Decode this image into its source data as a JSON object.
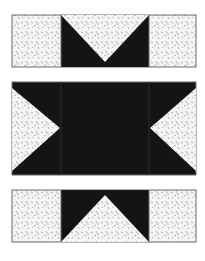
{
  "figure": {
    "colors": {
      "dark": "#141414",
      "light": "#f4f4f4",
      "speckle": "#9a9a9a",
      "border": "#6a6a6a"
    },
    "bands": [
      {
        "name": "top",
        "pieces": [
          "light-square",
          "flying-geese-down",
          "light-square"
        ]
      },
      {
        "name": "middle",
        "pieces": [
          "half-square-left",
          "dark-center",
          "half-square-right"
        ]
      },
      {
        "name": "bottom",
        "pieces": [
          "light-square",
          "flying-geese-up",
          "light-square"
        ]
      }
    ]
  }
}
